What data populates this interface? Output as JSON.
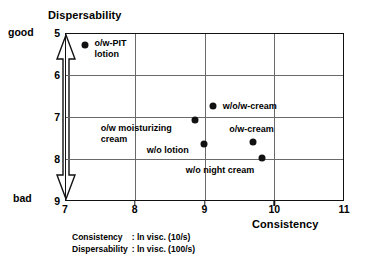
{
  "chart_data": {
    "type": "scatter",
    "title": "",
    "xlabel": "Consistency",
    "ylabel": "Dispersability",
    "xlim": [
      7,
      11
    ],
    "ylim": [
      5,
      9
    ],
    "y_inverted": true,
    "grid": true,
    "legend": "none",
    "x_ticks": [
      "7",
      "8",
      "9",
      "10",
      "11"
    ],
    "y_ticks": [
      "5",
      "6",
      "7",
      "8",
      "9"
    ],
    "y_axis_anchor_high": "good",
    "y_axis_anchor_low": "bad",
    "points": [
      {
        "label": "o/w-PIT\nlotion",
        "x": 7.28,
        "y": 5.28,
        "label_dx": 10,
        "label_dy": -7
      },
      {
        "label": "w/o/w-cream",
        "x": 9.12,
        "y": 6.73,
        "label_dx": 10,
        "label_dy": -5
      },
      {
        "label": "o/w moisturizing\ncream",
        "x": 8.86,
        "y": 7.07,
        "label_dx": -94,
        "label_dy": 3
      },
      {
        "label": "w/o lotion",
        "x": 8.99,
        "y": 7.65,
        "label_dx": -57,
        "label_dy": 1
      },
      {
        "label": "o/w-cream",
        "x": 9.7,
        "y": 7.6,
        "label_dx": -24,
        "label_dy": -18
      },
      {
        "label": "w/o night cream",
        "x": 9.82,
        "y": 7.98,
        "label_dx": -76,
        "label_dy": 7
      }
    ]
  },
  "footnote": [
    {
      "key": "Consistency",
      "sep": ": ",
      "value": "ln visc. (10/s)"
    },
    {
      "key": "Dispersability",
      "sep": ": ",
      "value": "ln visc. (100/s)"
    }
  ],
  "colors": {
    "frame": "#111111",
    "grid": "#6a6a6a",
    "marker": "#111111",
    "background": "#ffffff"
  }
}
